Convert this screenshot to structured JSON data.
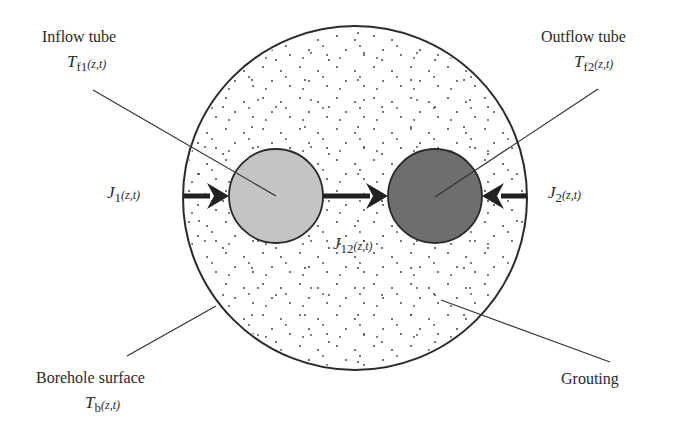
{
  "diagram": {
    "colors": {
      "background": "#ffffff",
      "outline": "#2a2a2a",
      "inflow_tube_fill": "#c4c4c4",
      "outflow_tube_fill": "#6e6e6e",
      "grout_dots": "#444444"
    },
    "labels": {
      "inflow_tube": {
        "name": "Inflow tube",
        "symbol": "T",
        "subscript": "f1",
        "args": "(z,t)"
      },
      "outflow_tube": {
        "name": "Outflow tube",
        "symbol": "T",
        "subscript": "f2",
        "args": "(z,t)"
      },
      "borehole_surface": {
        "name": "Borehole surface",
        "symbol": "T",
        "subscript": "b",
        "args": "(z,t)"
      },
      "grouting": {
        "name": "Grouting"
      },
      "flux_1": {
        "symbol": "J",
        "subscript": "1",
        "args": "(z,t)"
      },
      "flux_2": {
        "symbol": "J",
        "subscript": "2",
        "args": "(z,t)"
      },
      "flux_12": {
        "symbol": "J",
        "subscript": "12",
        "args": "(z,t)"
      }
    },
    "nodes": [
      {
        "id": "borehole",
        "shape": "circle",
        "cx": 355,
        "cy": 198,
        "r": 172
      },
      {
        "id": "inflow_tube",
        "shape": "circle",
        "cx": 276,
        "cy": 196,
        "r": 47
      },
      {
        "id": "outflow_tube",
        "shape": "circle",
        "cx": 435,
        "cy": 196,
        "r": 47
      }
    ],
    "edges": [
      {
        "from": "borehole",
        "to": "inflow_tube",
        "label": "J1(z,t)",
        "direction": "inward"
      },
      {
        "from": "inflow_tube",
        "to": "outflow_tube",
        "label": "J12(z,t)"
      },
      {
        "from": "borehole",
        "to": "outflow_tube",
        "label": "J2(z,t)",
        "direction": "inward"
      }
    ]
  }
}
